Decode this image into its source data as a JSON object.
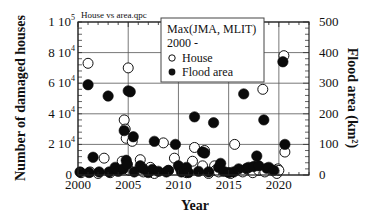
{
  "chart_data": {
    "type": "scatter",
    "title": "House vs area.qpc",
    "xlabel": "Year",
    "ylabel": "Number of damaged houses",
    "y2label": "Flood area (km²)",
    "xlim": [
      2000,
      2023
    ],
    "ylim": [
      0,
      100000
    ],
    "y2lim": [
      0,
      500
    ],
    "grid": true,
    "x_ticks": [
      2000,
      2005,
      2010,
      2015,
      2020
    ],
    "x_tick_labels": [
      "2000",
      "2005",
      "2010",
      "2015",
      "2020"
    ],
    "y_ticks": [
      0,
      20000,
      40000,
      60000,
      80000,
      100000
    ],
    "y_tick_labels": [
      {
        "mant": "0",
        "exp": ""
      },
      {
        "mant": "2 10",
        "exp": "4"
      },
      {
        "mant": "4 10",
        "exp": "4"
      },
      {
        "mant": "6 10",
        "exp": "4"
      },
      {
        "mant": "8 10",
        "exp": "4"
      },
      {
        "mant": "1 10",
        "exp": "5"
      }
    ],
    "y2_ticks": [
      0,
      100,
      200,
      300,
      400,
      500
    ],
    "y2_tick_labels": [
      "0",
      "100",
      "200",
      "300",
      "400",
      "500"
    ],
    "legend": {
      "title_line1": "Max(JMA, MLIT)",
      "title_line2": "2000 -",
      "position": "upper center",
      "entries": [
        "House",
        "Flood area"
      ]
    },
    "series": [
      {
        "name": "House",
        "axis": "left",
        "marker": "open-circle",
        "points": [
          [
            2000.3,
            1500
          ],
          [
            2001.0,
            73000
          ],
          [
            2001.2,
            2000
          ],
          [
            2002.0,
            1000
          ],
          [
            2002.6,
            11000
          ],
          [
            2003.2,
            1500
          ],
          [
            2004.0,
            4000
          ],
          [
            2004.4,
            9000
          ],
          [
            2004.6,
            36000
          ],
          [
            2004.7,
            30000
          ],
          [
            2004.8,
            24000
          ],
          [
            2004.9,
            7000
          ],
          [
            2005.0,
            70000
          ],
          [
            2005.1,
            3000
          ],
          [
            2005.4,
            22000
          ],
          [
            2006.2,
            10000
          ],
          [
            2006.5,
            2000
          ],
          [
            2007.2,
            5000
          ],
          [
            2007.6,
            1000
          ],
          [
            2008.5,
            21000
          ],
          [
            2009.0,
            3000
          ],
          [
            2009.6,
            11000
          ],
          [
            2010.2,
            4000
          ],
          [
            2010.8,
            1500
          ],
          [
            2011.4,
            9000
          ],
          [
            2011.6,
            18000
          ],
          [
            2012.4,
            6000
          ],
          [
            2012.6,
            16000
          ],
          [
            2013.0,
            1000
          ],
          [
            2013.6,
            6000
          ],
          [
            2013.7,
            3000
          ],
          [
            2014.0,
            2000
          ],
          [
            2015.2,
            1000
          ],
          [
            2015.6,
            20000
          ],
          [
            2016.4,
            2000
          ],
          [
            2016.8,
            4000
          ],
          [
            2017.4,
            1500
          ],
          [
            2017.8,
            6000
          ],
          [
            2018.0,
            3000
          ],
          [
            2018.4,
            56000
          ],
          [
            2018.6,
            2000
          ],
          [
            2019.4,
            3000
          ],
          [
            2019.8,
            1000
          ],
          [
            2019.9,
            4000
          ],
          [
            2020.0,
            3000
          ],
          [
            2020.5,
            78000
          ],
          [
            2020.6,
            15000
          ]
        ]
      },
      {
        "name": "Flood area",
        "axis": "right",
        "marker": "filled-circle",
        "points": [
          [
            2000.2,
            10
          ],
          [
            2001.0,
            295
          ],
          [
            2001.1,
            8
          ],
          [
            2001.5,
            58
          ],
          [
            2002.1,
            10
          ],
          [
            2003.0,
            258
          ],
          [
            2003.1,
            10
          ],
          [
            2003.7,
            25
          ],
          [
            2004.0,
            12
          ],
          [
            2004.5,
            20
          ],
          [
            2004.6,
            145
          ],
          [
            2004.8,
            48
          ],
          [
            2004.9,
            35
          ],
          [
            2005.0,
            275
          ],
          [
            2005.2,
            272
          ],
          [
            2005.5,
            125
          ],
          [
            2005.6,
            10
          ],
          [
            2006.2,
            30
          ],
          [
            2006.5,
            20
          ],
          [
            2007.0,
            8
          ],
          [
            2007.4,
            18
          ],
          [
            2007.6,
            110
          ],
          [
            2008.0,
            12
          ],
          [
            2008.8,
            10
          ],
          [
            2009.0,
            15
          ],
          [
            2009.7,
            100
          ],
          [
            2010.0,
            30
          ],
          [
            2010.3,
            10
          ],
          [
            2010.8,
            25
          ],
          [
            2011.0,
            8
          ],
          [
            2011.6,
            190
          ],
          [
            2012.0,
            12
          ],
          [
            2012.4,
            75
          ],
          [
            2012.6,
            72
          ],
          [
            2013.0,
            10
          ],
          [
            2013.5,
            171
          ],
          [
            2014.0,
            25
          ],
          [
            2014.2,
            38
          ],
          [
            2014.5,
            12
          ],
          [
            2015.0,
            8
          ],
          [
            2015.5,
            10
          ],
          [
            2016.5,
            265
          ],
          [
            2016.0,
            20
          ],
          [
            2016.8,
            22
          ],
          [
            2017.0,
            25
          ],
          [
            2017.5,
            28
          ],
          [
            2017.8,
            62
          ],
          [
            2018.0,
            30
          ],
          [
            2018.5,
            180
          ],
          [
            2018.8,
            22
          ],
          [
            2019.0,
            25
          ],
          [
            2019.5,
            15
          ],
          [
            2020.4,
            370
          ],
          [
            2020.6,
            100
          ]
        ]
      }
    ]
  }
}
